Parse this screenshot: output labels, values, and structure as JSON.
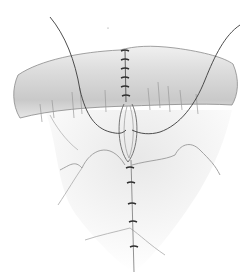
{
  "illustration": {
    "subject": "sutured tissue",
    "colors": {
      "background": "#ffffff",
      "tissue_fill": "#e4e4e4",
      "tissue_shade": "#c8c8c8",
      "line": "#6a6a6a",
      "suture": "#3a3a3a"
    },
    "stitches_upper_count": 6,
    "stitches_lower_count": 5
  }
}
